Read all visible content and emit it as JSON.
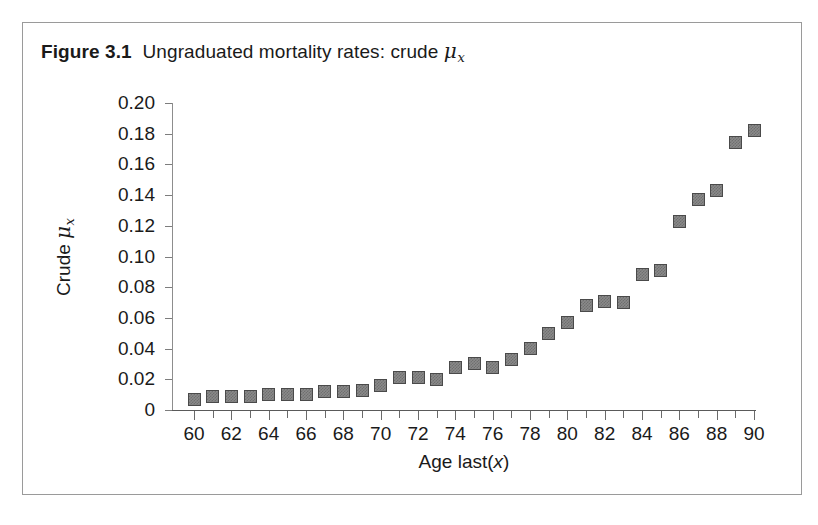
{
  "figure": {
    "label": "Figure 3.1",
    "caption_text": "Ungraduated mortality rates: crude",
    "caption_symbol": "μ",
    "caption_symbol_sub": "x"
  },
  "chart_data": {
    "type": "scatter",
    "xlabel": "Age last(x)",
    "ylabel": "Crude μx",
    "xlim": [
      59,
      91
    ],
    "ylim": [
      0,
      0.2
    ],
    "grid": false,
    "legend": null,
    "marker": "filled-square",
    "marker_color": "#7f7f7f",
    "marker_edge_color": "#4a4a4a",
    "x_tick_step": 2,
    "x_minor_tick_step": 1,
    "y_tick_step": 0.02,
    "x_ticks": [
      60,
      62,
      64,
      66,
      68,
      70,
      72,
      74,
      76,
      78,
      80,
      82,
      84,
      86,
      88,
      90
    ],
    "x_tick_labels": [
      "60",
      "62",
      "64",
      "66",
      "68",
      "70",
      "72",
      "74",
      "76",
      "78",
      "80",
      "82",
      "84",
      "86",
      "88",
      "90"
    ],
    "y_ticks": [
      0,
      0.02,
      0.04,
      0.06,
      0.08,
      0.1,
      0.12,
      0.14,
      0.16,
      0.18,
      0.2
    ],
    "y_tick_labels": [
      "0",
      "0.02",
      "0.04",
      "0.06",
      "0.08",
      "0.10",
      "0.12",
      "0.14",
      "0.16",
      "0.18",
      "0.20"
    ],
    "x": [
      60,
      61,
      62,
      63,
      64,
      65,
      66,
      67,
      68,
      69,
      70,
      71,
      72,
      73,
      74,
      75,
      76,
      77,
      78,
      79,
      80,
      81,
      82,
      83,
      84,
      85,
      86,
      87,
      88,
      89,
      90
    ],
    "y": [
      0.007,
      0.009,
      0.009,
      0.009,
      0.01,
      0.01,
      0.01,
      0.012,
      0.012,
      0.013,
      0.016,
      0.021,
      0.021,
      0.02,
      0.028,
      0.03,
      0.028,
      0.033,
      0.04,
      0.05,
      0.057,
      0.068,
      0.071,
      0.07,
      0.088,
      0.091,
      0.123,
      0.137,
      0.143,
      0.174,
      0.182
    ]
  },
  "colors": {
    "frame_border": "#9a9a9a",
    "axis": "#6a6a6a",
    "text": "#1a1a1a",
    "marker_fill": "#8a8a8a"
  }
}
